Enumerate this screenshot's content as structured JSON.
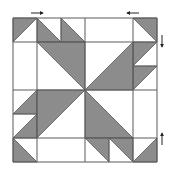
{
  "diagram": {
    "colors": {
      "background": "#ffffff",
      "fill": "#8c8c8c",
      "line": "#5a5a5a",
      "arrow": "#222222"
    },
    "grid": {
      "origin": [
        13,
        18
      ],
      "unit": 24,
      "size": 6,
      "vertical_lines": [
        13,
        37,
        85,
        133,
        157
      ],
      "horizontal_lines": [
        18,
        42,
        90,
        138,
        162
      ]
    },
    "triangles": [
      {
        "id": "tl-corner",
        "points": "13,18 37,18 13,42"
      },
      {
        "id": "top-a",
        "points": "37,18 37,42 61,42"
      },
      {
        "id": "top-b",
        "points": "61,18 61,42 85,42"
      },
      {
        "id": "center-tl",
        "points": "37,42 85,42 85,90"
      },
      {
        "id": "tr-corner",
        "points": "133,18 157,18 157,42"
      },
      {
        "id": "right-a",
        "points": "133,42 157,42 133,66"
      },
      {
        "id": "right-b",
        "points": "133,66 157,66 133,90"
      },
      {
        "id": "center-tr",
        "points": "133,42 133,90 85,90"
      },
      {
        "id": "left-a",
        "points": "37,90 37,114 13,114"
      },
      {
        "id": "left-b",
        "points": "37,114 37,138 13,138"
      },
      {
        "id": "center-bl",
        "points": "37,90 85,90 37,138"
      },
      {
        "id": "bl-corner",
        "points": "13,138 13,162 37,162"
      },
      {
        "id": "center-br",
        "points": "85,90 85,138 133,138"
      },
      {
        "id": "bottom-a",
        "points": "85,138 109,138 109,162"
      },
      {
        "id": "bottom-b",
        "points": "109,138 133,138 133,162"
      },
      {
        "id": "br-corner",
        "points": "157,138 157,162 133,162"
      }
    ],
    "segments": [
      {
        "id": "top-a-line",
        "x1": 61,
        "y1": 18,
        "x2": 61,
        "y2": 42
      },
      {
        "id": "bottom-a-line",
        "x1": 109,
        "y1": 138,
        "x2": 109,
        "y2": 162
      },
      {
        "id": "left-a-line",
        "x1": 13,
        "y1": 114,
        "x2": 37,
        "y2": 114
      },
      {
        "id": "right-a-line",
        "x1": 133,
        "y1": 66,
        "x2": 157,
        "y2": 66
      }
    ],
    "arrows": [
      {
        "id": "arrow-top-left",
        "direction": "right",
        "x1": 31,
        "y1": 13,
        "x2": 43,
        "y2": 13
      },
      {
        "id": "arrow-top-right",
        "direction": "left",
        "x1": 139,
        "y1": 13,
        "x2": 127,
        "y2": 13
      },
      {
        "id": "arrow-right-top",
        "direction": "down",
        "x1": 162,
        "y1": 35,
        "x2": 162,
        "y2": 47
      },
      {
        "id": "arrow-right-bottom",
        "direction": "up",
        "x1": 162,
        "y1": 145,
        "x2": 162,
        "y2": 133
      }
    ]
  }
}
